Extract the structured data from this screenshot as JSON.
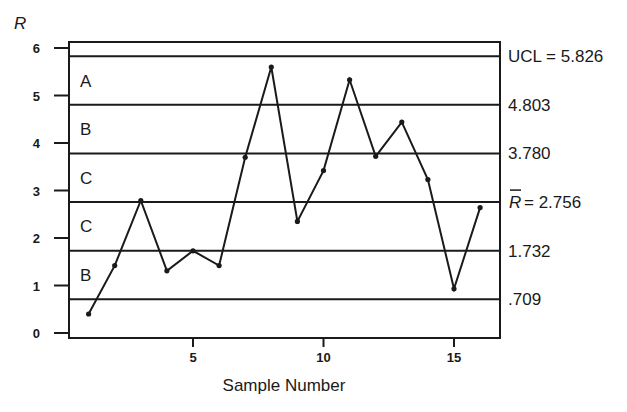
{
  "chart_data": {
    "type": "line",
    "title": "",
    "xlabel": "Sample Number",
    "ylabel": "R",
    "xlim": [
      0.2,
      16.8
    ],
    "ylim": [
      0,
      6.13
    ],
    "grid": false,
    "legend": null,
    "x_ticks": [
      5,
      10,
      15
    ],
    "x_tick_labels": [
      "5",
      "10",
      "15"
    ],
    "y_ticks": [
      0,
      1,
      2,
      3,
      4,
      5,
      6
    ],
    "y_tick_labels": [
      "0",
      "1",
      "2",
      "3",
      "4",
      "5",
      "6"
    ],
    "x": [
      1,
      2,
      3,
      4,
      5,
      6,
      7,
      8,
      9,
      10,
      11,
      12,
      13,
      14,
      15,
      16
    ],
    "series": [
      {
        "name": "R",
        "values": [
          0.4,
          1.42,
          2.79,
          1.31,
          1.73,
          1.42,
          3.7,
          5.6,
          2.35,
          3.42,
          5.33,
          3.72,
          4.44,
          3.23,
          0.93,
          2.64
        ]
      }
    ],
    "control_lines": [
      {
        "value": 5.826,
        "label": "UCL = 5.826",
        "kind": "ucl"
      },
      {
        "value": 4.803,
        "label": "4.803",
        "kind": "zone"
      },
      {
        "value": 3.78,
        "label": "3.780",
        "kind": "zone"
      },
      {
        "value": 2.756,
        "label": "= 2.756",
        "kind": "center",
        "symbol": "R"
      },
      {
        "value": 1.732,
        "label": "1.732",
        "kind": "zone"
      },
      {
        "value": 0.709,
        "label": ".709",
        "kind": "zone"
      }
    ],
    "zones": [
      {
        "label": "A",
        "from": 4.803,
        "to": 5.826
      },
      {
        "label": "B",
        "from": 3.78,
        "to": 4.803
      },
      {
        "label": "C",
        "from": 2.756,
        "to": 3.78
      },
      {
        "label": "C",
        "from": 1.732,
        "to": 2.756
      },
      {
        "label": "B",
        "from": 0.709,
        "to": 1.732
      }
    ]
  }
}
